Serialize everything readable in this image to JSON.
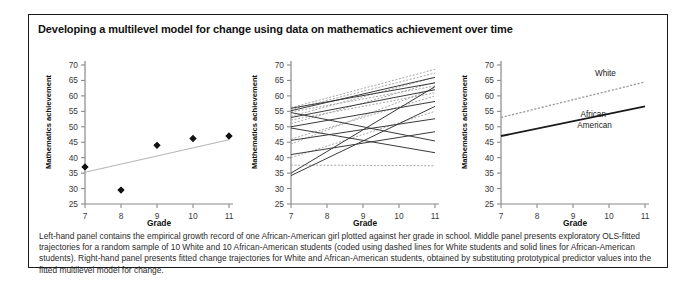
{
  "figure": {
    "title": "Developing a multilevel model for change using data on mathematics achievement over time",
    "caption": "Left-hand panel contains the empirical growth record of one African-American girl plotted against her grade in school. Middle panel presents exploratory OLS-fitted trajectories for a random sample of 10 White and 10 African-American students (coded using dashed lines for White students and solid lines for African-American students). Right-hand panel presents fitted change trajectories for White and African-American students, obtained by substituting prototypical predictor values into the fitted multilevel model for change.",
    "border_color": "#1a1a1a",
    "background": "#ffffff"
  },
  "axes": {
    "xlabel": "Grade",
    "ylabel": "Mathematics achievement",
    "xticks": [
      7,
      8,
      9,
      10,
      11
    ],
    "yticks": [
      25,
      30,
      35,
      40,
      45,
      50,
      55,
      60,
      65,
      70
    ],
    "xlim": [
      7,
      11
    ],
    "ylim": [
      25,
      70
    ]
  },
  "chart_data": [
    {
      "type": "scatter",
      "panel": "left",
      "title": "Empirical growth record of one African-American girl",
      "xlabel": "Grade",
      "ylabel": "Mathematics achievement",
      "xlim": [
        7,
        11
      ],
      "ylim": [
        25,
        70
      ],
      "grid": false,
      "legend": "none",
      "x": [
        7,
        8,
        9,
        10,
        11
      ],
      "values": [
        37.0,
        29.5,
        44.0,
        46.2,
        47.0
      ],
      "point_color": "#111111",
      "point_marker": "diamond",
      "fit_line": {
        "name": "OLS fit",
        "style": "solid-light",
        "color": "#b6b6b6",
        "x": [
          7,
          11
        ],
        "y": [
          35.3,
          45.8
        ]
      }
    },
    {
      "type": "line",
      "panel": "middle",
      "title": "Exploratory OLS-fitted trajectories, 10 White and 10 African-American students",
      "xlabel": "Grade",
      "ylabel": "Mathematics achievement",
      "xlim": [
        7,
        11
      ],
      "ylim": [
        25,
        70
      ],
      "grid": false,
      "legend": "none",
      "x": [
        7,
        11
      ],
      "series": [
        {
          "name": "White 1",
          "group": "White",
          "style": "dashed",
          "values": [
            56.2,
            68.6
          ]
        },
        {
          "name": "White 2",
          "group": "White",
          "style": "dashed",
          "values": [
            55.6,
            67.4
          ]
        },
        {
          "name": "White 3",
          "group": "White",
          "style": "dashed",
          "values": [
            54.8,
            63.2
          ]
        },
        {
          "name": "White 4",
          "group": "White",
          "style": "dashed",
          "values": [
            53.4,
            66.0
          ]
        },
        {
          "name": "White 5",
          "group": "White",
          "style": "dashed",
          "values": [
            52.2,
            61.0
          ]
        },
        {
          "name": "White 6",
          "group": "White",
          "style": "dashed",
          "values": [
            51.0,
            64.4
          ]
        },
        {
          "name": "White 7",
          "group": "White",
          "style": "dashed",
          "values": [
            46.0,
            60.0
          ]
        },
        {
          "name": "White 8",
          "group": "White",
          "style": "dashed",
          "values": [
            44.4,
            62.6
          ]
        },
        {
          "name": "White 9",
          "group": "White",
          "style": "dashed",
          "values": [
            40.0,
            55.0
          ]
        },
        {
          "name": "White 10",
          "group": "White",
          "style": "dashed",
          "values": [
            37.6,
            37.4
          ]
        },
        {
          "name": "African-American 1",
          "group": "African-American",
          "style": "solid",
          "values": [
            56.0,
            64.2
          ]
        },
        {
          "name": "African-American 2",
          "group": "African-American",
          "style": "solid",
          "values": [
            55.2,
            66.0
          ]
        },
        {
          "name": "African-American 3",
          "group": "African-American",
          "style": "solid",
          "values": [
            54.6,
            45.4
          ]
        },
        {
          "name": "African-American 4",
          "group": "African-American",
          "style": "solid",
          "values": [
            53.0,
            62.0
          ]
        },
        {
          "name": "African-American 5",
          "group": "African-American",
          "style": "solid",
          "values": [
            50.0,
            58.2
          ]
        },
        {
          "name": "African-American 6",
          "group": "African-American",
          "style": "solid",
          "values": [
            49.6,
            41.6
          ]
        },
        {
          "name": "African-American 7",
          "group": "African-American",
          "style": "solid",
          "values": [
            45.6,
            52.6
          ]
        },
        {
          "name": "African-American 8",
          "group": "African-American",
          "style": "solid",
          "values": [
            41.0,
            48.4
          ]
        },
        {
          "name": "African-American 9",
          "group": "African-American",
          "style": "solid",
          "values": [
            35.0,
            63.0
          ]
        },
        {
          "name": "African-American 10",
          "group": "African-American",
          "style": "solid",
          "values": [
            34.2,
            56.6
          ]
        }
      ]
    },
    {
      "type": "line",
      "panel": "right",
      "title": "Fitted change trajectories from the multilevel model",
      "xlabel": "Grade",
      "ylabel": "Mathematics achievement",
      "xlim": [
        7,
        11
      ],
      "ylim": [
        25,
        70
      ],
      "grid": false,
      "legend": "inline-annotations",
      "x": [
        7,
        11
      ],
      "series": [
        {
          "name": "White",
          "style": "dashed",
          "color": "#9a9a9a",
          "values": [
            53.0,
            64.5
          ],
          "label": "White"
        },
        {
          "name": "African-American",
          "style": "solid",
          "color": "#1a1a1a",
          "values": [
            47.0,
            56.6
          ],
          "label": "African-\nAmerican"
        }
      ],
      "annotations": [
        {
          "text": "White",
          "x": 9.9,
          "y": 66.4
        },
        {
          "text": "African-",
          "x": 9.6,
          "y": 53.3
        },
        {
          "text": "American",
          "x": 9.6,
          "y": 49.6
        }
      ]
    }
  ]
}
